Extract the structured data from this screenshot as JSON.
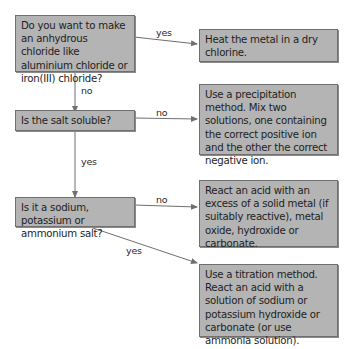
{
  "diagram": {
    "type": "flowchart",
    "colors": {
      "box_fill": "#b4b4b4",
      "box_border": "#6f6f6f",
      "line": "#6f6f6f"
    },
    "questions": [
      {
        "id": "q1",
        "text": "Do you want to make an anhydrous chloride like aluminium chloride or iron(III) chloride?"
      },
      {
        "id": "q2",
        "text": "Is the salt soluble?"
      },
      {
        "id": "q3",
        "text": "Is it a sodium, potassium or ammonium salt?"
      }
    ],
    "outcomes": [
      {
        "id": "a",
        "text": "Heat the metal in a dry chlorine."
      },
      {
        "id": "b",
        "text": "Use a precipitation method. Mix two solutions, one containing the correct positive ion and the other the correct negative ion."
      },
      {
        "id": "c",
        "text": "React an acid with an excess of a solid metal (if suitably reactive), metal oxide, hydroxide or carbonate."
      },
      {
        "id": "d",
        "text": "Use a titration method. React an acid with a solution of sodium or potassium hydroxide or carbonate (or use ammonia solution)."
      }
    ],
    "edges": [
      {
        "from": "q1",
        "to": "a",
        "label": "yes"
      },
      {
        "from": "q1",
        "to": "q2",
        "label": "no"
      },
      {
        "from": "q2",
        "to": "b",
        "label": "no"
      },
      {
        "from": "q2",
        "to": "q3",
        "label": "yes"
      },
      {
        "from": "q3",
        "to": "c",
        "label": "no"
      },
      {
        "from": "q3",
        "to": "d",
        "label": "yes"
      }
    ]
  }
}
